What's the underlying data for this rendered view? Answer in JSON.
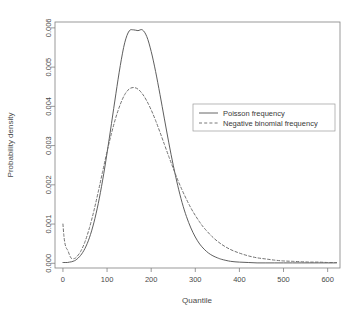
{
  "chart_data": {
    "type": "line",
    "title": "",
    "xlabel": "Quantile",
    "ylabel": "Probability density",
    "xlim": [
      -18,
      628
    ],
    "ylim": [
      -0.00012,
      0.00615
    ],
    "xticks": [
      0,
      100,
      200,
      300,
      400,
      500,
      600
    ],
    "xtick_labels": [
      "0",
      "100",
      "200",
      "300",
      "400",
      "500",
      "600"
    ],
    "yticks": [
      0.0,
      0.001,
      0.002,
      0.003,
      0.004,
      0.005,
      0.006
    ],
    "ytick_labels": [
      "0.000",
      "0.001",
      "0.002",
      "0.003",
      "0.004",
      "0.005",
      "0.006"
    ],
    "grid": false,
    "legend_position": "center-right",
    "series": [
      {
        "name": "Poisson frequency",
        "style": "solid",
        "color": "#555555",
        "x": [
          0,
          5,
          10,
          15,
          20,
          25,
          30,
          40,
          50,
          60,
          70,
          80,
          90,
          100,
          110,
          120,
          130,
          140,
          150,
          160,
          170,
          180,
          190,
          200,
          210,
          220,
          230,
          240,
          250,
          260,
          270,
          280,
          290,
          300,
          310,
          320,
          330,
          340,
          350,
          360,
          380,
          400,
          420,
          440,
          460,
          480,
          500,
          520,
          540,
          560,
          580,
          600,
          620
        ],
        "y": [
          2e-05,
          2e-05,
          2e-05,
          3e-05,
          4e-05,
          6e-05,
          9e-05,
          0.0002,
          0.00038,
          0.00065,
          0.00103,
          0.00152,
          0.00212,
          0.00281,
          0.00356,
          0.00432,
          0.00504,
          0.00562,
          0.00592,
          0.00595,
          0.00593,
          0.00595,
          0.00578,
          0.0054,
          0.00489,
          0.0043,
          0.00368,
          0.00307,
          0.0025,
          0.00199,
          0.00155,
          0.00119,
          0.0009,
          0.00067,
          0.00049,
          0.00036,
          0.00026,
          0.00019,
          0.00014,
          0.0001,
          5e-05,
          3e-05,
          2e-05,
          1e-05,
          1e-05,
          1e-05,
          1e-05,
          1e-05,
          1e-05,
          1e-05,
          1e-05,
          1e-05,
          1e-05
        ]
      },
      {
        "name": "Negative binomial frequency",
        "style": "dashed",
        "color": "#6a6a6a",
        "x": [
          0,
          2,
          4,
          6,
          8,
          10,
          12,
          14,
          16,
          18,
          20,
          25,
          30,
          40,
          50,
          60,
          70,
          80,
          90,
          100,
          110,
          120,
          130,
          140,
          150,
          160,
          170,
          180,
          190,
          200,
          210,
          220,
          230,
          240,
          250,
          260,
          270,
          280,
          290,
          300,
          310,
          320,
          340,
          360,
          380,
          400,
          420,
          440,
          460,
          480,
          500,
          520,
          540,
          560,
          580,
          600,
          620
        ],
        "y": [
          0.001,
          0.00072,
          0.00054,
          0.00044,
          0.00038,
          0.00035,
          0.0003,
          0.00024,
          0.00018,
          0.00014,
          0.00012,
          0.00012,
          0.00015,
          0.0003,
          0.00055,
          0.0009,
          0.00133,
          0.00182,
          0.00234,
          0.00285,
          0.00331,
          0.00372,
          0.00405,
          0.0043,
          0.00444,
          0.00448,
          0.00444,
          0.00432,
          0.00414,
          0.00391,
          0.00364,
          0.00334,
          0.00303,
          0.00272,
          0.00242,
          0.00213,
          0.00187,
          0.00163,
          0.00141,
          0.00122,
          0.00105,
          0.0009,
          0.00066,
          0.00048,
          0.00035,
          0.00026,
          0.00019,
          0.00014,
          0.00011,
          8e-05,
          6e-05,
          5e-05,
          4e-05,
          3e-05,
          3e-05,
          2e-05,
          2e-05
        ]
      }
    ],
    "legend": [
      {
        "label": "Poisson frequency",
        "style": "solid"
      },
      {
        "label": "Negative binomial frequency",
        "style": "dashed"
      }
    ]
  }
}
